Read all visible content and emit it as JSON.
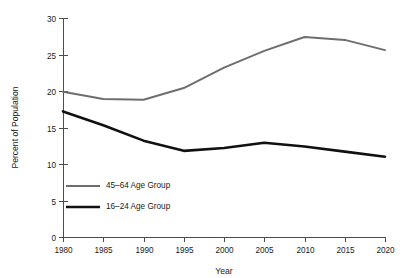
{
  "chart_data": {
    "type": "line",
    "title": "",
    "xlabel": "Year",
    "ylabel": "Percent of Population",
    "x": [
      1980,
      1985,
      1990,
      1995,
      2000,
      2005,
      2010,
      2015,
      2020
    ],
    "categories": [
      "1980",
      "1985",
      "1990",
      "1995",
      "2000",
      "2005",
      "2010",
      "2015",
      "2020"
    ],
    "xlim": [
      1980,
      2020
    ],
    "ylim": [
      0,
      30
    ],
    "yticks": [
      0,
      5,
      10,
      15,
      20,
      25,
      30
    ],
    "ytick_labels": [
      "0",
      "5",
      "10",
      "15",
      "20",
      "25",
      "30"
    ],
    "xticks": [
      1980,
      1985,
      1990,
      1995,
      2000,
      2005,
      2010,
      2015,
      2020
    ],
    "xtick_labels": [
      "1980",
      "1985",
      "1990",
      "1995",
      "2000",
      "2005",
      "2010",
      "2015",
      "2020"
    ],
    "grid": false,
    "legend_position": "inside-lower-left",
    "series": [
      {
        "name": "45-64 Age Group",
        "label": "45–64 Age Group",
        "color": "#6e6e6e",
        "width": 2.0,
        "values": [
          19.9,
          18.9,
          18.8,
          20.4,
          23.2,
          25.5,
          27.4,
          27.0,
          25.6
        ]
      },
      {
        "name": "16-24 Age Group",
        "label": "16–24 Age Group",
        "color": "#111111",
        "width": 2.6,
        "values": [
          17.2,
          15.3,
          13.2,
          11.8,
          12.2,
          12.9,
          12.4,
          11.7,
          11.0
        ]
      }
    ]
  },
  "axes": {
    "y_title": "Percent of Population",
    "x_title": "Year"
  },
  "legend": {
    "entries": [
      {
        "label": "45–64 Age Group"
      },
      {
        "label": "16–24 Age Group"
      }
    ]
  },
  "geometry": {
    "plot_left": 63,
    "plot_right": 385,
    "plot_top": 18,
    "plot_bottom": 237,
    "legend_x_line_start": 66,
    "legend_x_line_end": 100,
    "legend_x_text": 106,
    "legend_y_first": 186,
    "legend_y_step": 21
  }
}
